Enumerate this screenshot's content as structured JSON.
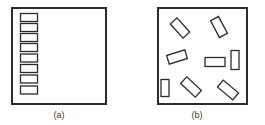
{
  "figure": {
    "background_color": "#ffffff",
    "stroke_color": "#2b2b2b",
    "fill_color": "#ffffff",
    "caption_color": "#3a3a3a"
  },
  "panels": [
    {
      "id": "panel-a",
      "caption": "(a)",
      "caption_x": 59,
      "caption_y": 115,
      "frame": {
        "x": 11,
        "y": 7,
        "width": 96,
        "height": 98,
        "stroke_width": 2
      },
      "arrangement": "aligned-vertical-stack",
      "shape_count": 8,
      "shapes": [
        {
          "x": 20,
          "y": 13,
          "width": 17,
          "height": 8,
          "angle": 0
        },
        {
          "x": 20,
          "y": 23,
          "width": 17,
          "height": 8,
          "angle": 0
        },
        {
          "x": 20,
          "y": 33,
          "width": 17,
          "height": 8,
          "angle": 0
        },
        {
          "x": 20,
          "y": 43,
          "width": 17,
          "height": 8,
          "angle": 0
        },
        {
          "x": 20,
          "y": 54,
          "width": 17,
          "height": 8,
          "angle": 0
        },
        {
          "x": 20,
          "y": 64,
          "width": 17,
          "height": 8,
          "angle": 0
        },
        {
          "x": 20,
          "y": 75,
          "width": 17,
          "height": 8,
          "angle": 0
        },
        {
          "x": 20,
          "y": 86,
          "width": 17,
          "height": 8,
          "angle": 0
        }
      ]
    },
    {
      "id": "panel-b",
      "caption": "(b)",
      "caption_x": 197,
      "caption_y": 115,
      "frame": {
        "x": 157,
        "y": 7,
        "width": 91,
        "height": 98,
        "stroke_width": 2
      },
      "arrangement": "random-orientation",
      "shape_count": 9,
      "shapes": [
        {
          "cx": 180,
          "cy": 28,
          "width": 19,
          "height": 9,
          "angle": 48
        },
        {
          "cx": 219,
          "cy": 27,
          "width": 19,
          "height": 9,
          "angle": 62
        },
        {
          "cx": 177,
          "cy": 57,
          "width": 19,
          "height": 9,
          "angle": -17
        },
        {
          "cx": 215,
          "cy": 62,
          "width": 20,
          "height": 9,
          "angle": 0
        },
        {
          "cx": 235,
          "cy": 60,
          "width": 19,
          "height": 8,
          "angle": 90
        },
        {
          "cx": 165,
          "cy": 88,
          "width": 17,
          "height": 8,
          "angle": 90
        },
        {
          "cx": 191,
          "cy": 87,
          "width": 20,
          "height": 9,
          "angle": 43
        },
        {
          "cx": 228,
          "cy": 90,
          "width": 20,
          "height": 9,
          "angle": 40
        },
        {
          "cx": 207,
          "cy": 79,
          "width": 0,
          "height": 0,
          "angle": 0
        }
      ]
    }
  ]
}
